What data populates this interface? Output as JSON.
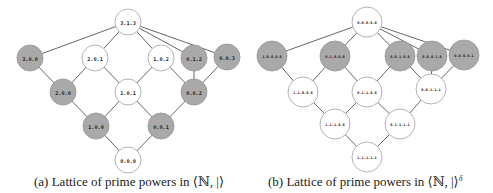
{
  "figure": {
    "subfigure_a": {
      "caption": "(a) Lattice of prime powers in ⟨ℕ, |⟩",
      "node_radius": 13,
      "colors": {
        "highlighted": "#a9a9a9",
        "plain": "#ffffff"
      },
      "nodes": [
        {
          "id": "313",
          "label": "3.1.3",
          "x": 128,
          "y": 22,
          "shaded": false
        },
        {
          "id": "300",
          "label": "3.0.0",
          "x": 30,
          "y": 58,
          "shaded": true
        },
        {
          "id": "201",
          "label": "2.0.1",
          "x": 95,
          "y": 58,
          "shaded": false
        },
        {
          "id": "102",
          "label": "1.0.2",
          "x": 161,
          "y": 58,
          "shaded": false
        },
        {
          "id": "012",
          "label": "0.1.2",
          "x": 194,
          "y": 58,
          "shaded": true
        },
        {
          "id": "003",
          "label": "0.0.3",
          "x": 227,
          "y": 57,
          "shaded": true
        },
        {
          "id": "200",
          "label": "2.0.0",
          "x": 63,
          "y": 92,
          "shaded": true
        },
        {
          "id": "101",
          "label": "1.0.1",
          "x": 128,
          "y": 92,
          "shaded": false
        },
        {
          "id": "002",
          "label": "0.0.2",
          "x": 194,
          "y": 92,
          "shaded": true
        },
        {
          "id": "100",
          "label": "1.0.0",
          "x": 96,
          "y": 126,
          "shaded": true
        },
        {
          "id": "001",
          "label": "0.0.1",
          "x": 161,
          "y": 126,
          "shaded": true
        },
        {
          "id": "000",
          "label": "0.0.0",
          "x": 128,
          "y": 160,
          "shaded": false
        }
      ],
      "edges": [
        [
          "313",
          "300"
        ],
        [
          "313",
          "201"
        ],
        [
          "313",
          "102"
        ],
        [
          "313",
          "012"
        ],
        [
          "313",
          "003"
        ],
        [
          "300",
          "200"
        ],
        [
          "201",
          "200"
        ],
        [
          "201",
          "101"
        ],
        [
          "102",
          "101"
        ],
        [
          "102",
          "002"
        ],
        [
          "012",
          "002"
        ],
        [
          "003",
          "002"
        ],
        [
          "200",
          "100"
        ],
        [
          "101",
          "100"
        ],
        [
          "101",
          "001"
        ],
        [
          "002",
          "001"
        ],
        [
          "100",
          "000"
        ],
        [
          "001",
          "000"
        ]
      ]
    },
    "subfigure_b": {
      "caption_prefix": "(b) Lattice of prime powers in ⟨ℕ, |⟩",
      "caption_superscript": "δ",
      "node_radius": 15,
      "colors": {
        "highlighted": "#a9a9a9",
        "plain": "#ffffff"
      },
      "nodes": [
        {
          "id": "t",
          "label": "0.0.0.0.0",
          "x": 367,
          "y": 22,
          "shaded": false
        },
        {
          "id": "r1a",
          "label": "1.0.0.0.0",
          "x": 272,
          "y": 56,
          "shaded": true
        },
        {
          "id": "r1b",
          "label": "0.1.0.0.0",
          "x": 335,
          "y": 56,
          "shaded": true
        },
        {
          "id": "r1c",
          "label": "0.0.1.0.0",
          "x": 400,
          "y": 56,
          "shaded": true
        },
        {
          "id": "r1d",
          "label": "0.0.0.1.0",
          "x": 432,
          "y": 56,
          "shaded": true
        },
        {
          "id": "r1e",
          "label": "0.0.0.0.1",
          "x": 464,
          "y": 55,
          "shaded": true
        },
        {
          "id": "r2a",
          "label": "1.1.0.0.0",
          "x": 303,
          "y": 92,
          "shaded": false
        },
        {
          "id": "r2b",
          "label": "0.1.1.0.0",
          "x": 367,
          "y": 92,
          "shaded": false
        },
        {
          "id": "r2c",
          "label": "0.0.1.1.1",
          "x": 431,
          "y": 89,
          "shaded": false
        },
        {
          "id": "r3a",
          "label": "1.1.1.0.0",
          "x": 335,
          "y": 124,
          "shaded": false
        },
        {
          "id": "r3b",
          "label": "0.1.1.1.1",
          "x": 400,
          "y": 124,
          "shaded": false
        },
        {
          "id": "bot",
          "label": "1.1.1.1.1",
          "x": 367,
          "y": 157,
          "shaded": false
        }
      ],
      "edges": [
        [
          "t",
          "r1a"
        ],
        [
          "t",
          "r1b"
        ],
        [
          "t",
          "r1c"
        ],
        [
          "t",
          "r1d"
        ],
        [
          "t",
          "r1e"
        ],
        [
          "r1a",
          "r2a"
        ],
        [
          "r1b",
          "r2a"
        ],
        [
          "r1b",
          "r2b"
        ],
        [
          "r1c",
          "r2b"
        ],
        [
          "r1c",
          "r2c"
        ],
        [
          "r1d",
          "r2c"
        ],
        [
          "r1e",
          "r2c"
        ],
        [
          "r2a",
          "r3a"
        ],
        [
          "r2b",
          "r3a"
        ],
        [
          "r2b",
          "r3b"
        ],
        [
          "r2c",
          "r3b"
        ],
        [
          "r3a",
          "bot"
        ],
        [
          "r3b",
          "bot"
        ]
      ]
    }
  }
}
